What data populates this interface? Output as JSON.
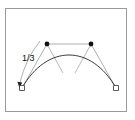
{
  "figure": {
    "background_color": "#ffffff",
    "frame_color": "#9a9a9a",
    "curve_color": "#3a3a3a",
    "polygon_color": "#8c8c8c",
    "marker_fill": "#111111",
    "endpoint_fill": "#ffffff",
    "endpoint_stroke": "#333333"
  },
  "labels": {
    "ratio": "1/3"
  },
  "geometry": {
    "curve": {
      "type": "cubic-bezier",
      "start": [
        22,
        88
      ],
      "control1": [
        47,
        44
      ],
      "control2": [
        91,
        44
      ],
      "end": [
        116,
        88
      ]
    },
    "endpoints": [
      {
        "name": "start-endpoint",
        "x": 22,
        "y": 88,
        "shape": "square"
      },
      {
        "name": "end-endpoint",
        "x": 116,
        "y": 88,
        "shape": "square"
      }
    ],
    "control_points": [
      {
        "name": "control-point-1",
        "x": 47,
        "y": 44,
        "shape": "dot"
      },
      {
        "name": "control-point-2",
        "x": 91,
        "y": 44,
        "shape": "dot"
      }
    ],
    "hull_lines": [
      {
        "name": "hull-start-to-c1",
        "x1": 22,
        "y1": 88,
        "x2": 47,
        "y2": 44
      },
      {
        "name": "hull-c1-to-c2",
        "x1": 47,
        "y1": 44,
        "x2": 91,
        "y2": 44
      },
      {
        "name": "hull-c2-to-end",
        "x1": 91,
        "y1": 44,
        "x2": 116,
        "y2": 88
      }
    ],
    "tangent_lines": [
      {
        "name": "tangent-left",
        "x1": 47,
        "y1": 44,
        "x2": 62,
        "y2": 72
      },
      {
        "name": "tangent-right",
        "x1": 91,
        "y1": 44,
        "x2": 76,
        "y2": 72
      }
    ],
    "arrow": {
      "name": "one-third-arrow",
      "x1": 40,
      "y1": 41,
      "x2": 19,
      "y2": 85
    }
  }
}
